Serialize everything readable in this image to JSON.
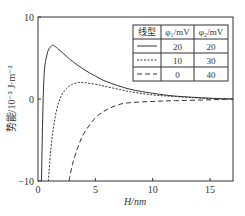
{
  "chart_data": {
    "type": "line",
    "title": "",
    "xlabel": "H/nm",
    "ylabel": "势能/10⁻⁵ J·m⁻²",
    "xlim": [
      0,
      17
    ],
    "ylim": [
      -10,
      10
    ],
    "xticks": [
      "0",
      "5",
      "10",
      "15"
    ],
    "yticks": [
      "-10",
      "0",
      "10"
    ],
    "grid": false,
    "legend_position": "upper-right table",
    "legend_table": {
      "headers": [
        "线型",
        "φ₁/mV",
        "φ₂/mV"
      ],
      "rows": [
        {
          "linestyle": "solid",
          "phi1": "20",
          "phi2": "20"
        },
        {
          "linestyle": "dotted",
          "phi1": "10",
          "phi2": "30"
        },
        {
          "linestyle": "dashed",
          "phi1": "0",
          "phi2": "40"
        }
      ]
    },
    "series": [
      {
        "name": "φ1=20, φ2=20",
        "style": "solid",
        "x": [
          0.3,
          0.5,
          0.8,
          1.2,
          1.5,
          2,
          3,
          4,
          5,
          6,
          8,
          10,
          12,
          15,
          17
        ],
        "y": [
          -10,
          2,
          5.5,
          6.5,
          6.4,
          5.8,
          4.6,
          3.6,
          2.8,
          2.1,
          1.2,
          0.7,
          0.35,
          0.1,
          0.0
        ]
      },
      {
        "name": "φ1=10, φ2=30",
        "style": "dotted",
        "x": [
          0.9,
          1.2,
          1.6,
          2,
          2.5,
          3,
          3.5,
          4,
          5,
          6,
          8,
          10,
          12,
          15,
          17
        ],
        "y": [
          -10,
          -5,
          -1.5,
          0.3,
          1.3,
          1.8,
          2.0,
          2.0,
          1.8,
          1.5,
          0.9,
          0.5,
          0.3,
          0.05,
          0.0
        ]
      },
      {
        "name": "φ1=0, φ2=40",
        "style": "dashed",
        "x": [
          2.7,
          3,
          3.5,
          4,
          5,
          6,
          7,
          8,
          10,
          12,
          15,
          17
        ],
        "y": [
          -10,
          -8,
          -5.8,
          -4.2,
          -2.3,
          -1.3,
          -0.7,
          -0.45,
          -0.3,
          -0.2,
          -0.1,
          0.0
        ]
      }
    ]
  },
  "axes": {
    "xlabel": "H/nm",
    "ylabel": "势能/10⁻⁵ J·m⁻²",
    "xticks": [
      "0",
      "5",
      "10",
      "15"
    ],
    "yticks": [
      "10",
      "0",
      "−10"
    ]
  },
  "legend": {
    "headers": [
      "线型",
      "φ₁/mV",
      "φ₂/mV"
    ],
    "rows": [
      [
        "20",
        "20"
      ],
      [
        "10",
        "30"
      ],
      [
        "0",
        "40"
      ]
    ]
  }
}
